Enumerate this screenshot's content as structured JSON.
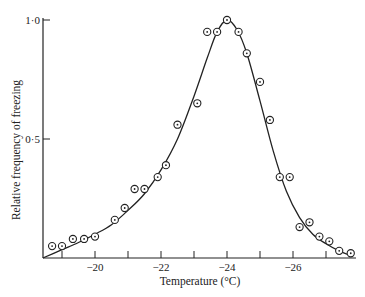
{
  "chart_data": {
    "type": "scatter",
    "title": "",
    "xlabel": "Temperature (°C)",
    "ylabel": "Relative frequency of freezing",
    "xlim": [
      -18.42,
      -28.5
    ],
    "ylim": [
      0,
      1.0
    ],
    "x_ticks": [
      -19,
      -20,
      -21,
      -22,
      -23,
      -24,
      -25,
      -26,
      -27
    ],
    "x_tick_labels": [
      {
        "value": -20,
        "label": "−20"
      },
      {
        "value": -22,
        "label": "−22"
      },
      {
        "value": -24,
        "label": "−24"
      },
      {
        "value": -26,
        "label": "−26"
      }
    ],
    "y_tick_labels": [
      {
        "value": 1.0,
        "label": "1·0"
      },
      {
        "value": 0.5,
        "label": "0·5"
      }
    ],
    "grid": false,
    "legend": null,
    "series": [
      {
        "name": "observed",
        "marker": "circled-dot",
        "x": [
          -18.7,
          -19.0,
          -19.33,
          -19.67,
          -20.0,
          -20.6,
          -20.9,
          -21.2,
          -21.5,
          -21.9,
          -22.15,
          -22.5,
          -23.1,
          -23.4,
          -23.7,
          -24.0,
          -24.35,
          -24.6,
          -25.0,
          -25.3,
          -25.6,
          -25.9,
          -26.2,
          -26.5,
          -26.8,
          -27.1,
          -27.4,
          -27.75
        ],
        "values": [
          0.05,
          0.05,
          0.08,
          0.08,
          0.09,
          0.16,
          0.21,
          0.29,
          0.29,
          0.34,
          0.39,
          0.56,
          0.65,
          0.95,
          0.95,
          1.0,
          0.95,
          0.86,
          0.74,
          0.58,
          0.34,
          0.34,
          0.13,
          0.15,
          0.09,
          0.07,
          0.03,
          0.02
        ]
      },
      {
        "name": "fitted curve",
        "style": "line",
        "x": [
          -18.42,
          -19.0,
          -19.5,
          -20.0,
          -20.5,
          -21.0,
          -21.5,
          -22.0,
          -22.5,
          -23.0,
          -23.4,
          -23.7,
          -24.0,
          -24.3,
          -24.6,
          -25.0,
          -25.4,
          -25.8,
          -26.2,
          -26.6,
          -27.0,
          -27.4,
          -27.75
        ],
        "values": [
          0.0,
          0.035,
          0.065,
          0.1,
          0.14,
          0.2,
          0.27,
          0.37,
          0.5,
          0.68,
          0.84,
          0.95,
          1.0,
          0.96,
          0.86,
          0.66,
          0.45,
          0.28,
          0.17,
          0.1,
          0.06,
          0.03,
          0.01
        ]
      }
    ]
  }
}
